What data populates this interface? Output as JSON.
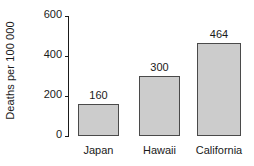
{
  "chart_data": {
    "type": "bar",
    "title": "",
    "subtitle": "",
    "xlabel": "",
    "ylabel": "Deaths per 100 000",
    "categories": [
      "Japan",
      "Hawaii",
      "California"
    ],
    "values": [
      160,
      300,
      464
    ],
    "value_labels": [
      "160",
      "300",
      "464"
    ],
    "ylim": [
      0,
      600
    ],
    "yticks": [
      0,
      200,
      400,
      600
    ],
    "ytick_labels": [
      "0",
      "200",
      "400",
      "600"
    ],
    "grid": false,
    "legend": null,
    "annotations": [],
    "colors": {
      "bar_fill": "#cccccc",
      "bar_border": "#4a4a4a",
      "axis": "#1a1a1a",
      "text": "#1a1a1a",
      "background": "#ffffff"
    }
  }
}
